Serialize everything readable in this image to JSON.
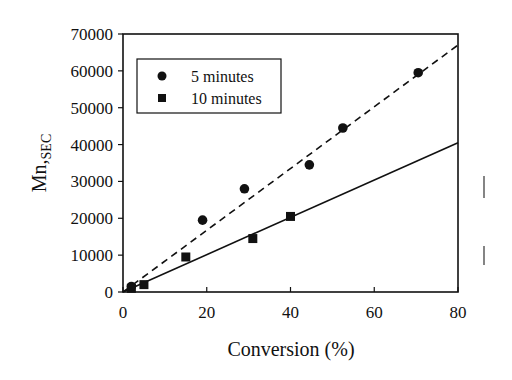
{
  "chart_data": {
    "type": "scatter",
    "title": "",
    "xlabel": "Conversion (%)",
    "ylabel": "Mn,SEC",
    "ylabel_main": "Mn,",
    "ylabel_sub": "SEC",
    "xlim": [
      0,
      80
    ],
    "ylim": [
      0,
      70000
    ],
    "xticks": [
      "0",
      "20",
      "40",
      "60",
      "80"
    ],
    "yticks": [
      "0",
      "10000",
      "20000",
      "30000",
      "40000",
      "50000",
      "60000",
      "70000"
    ],
    "grid": false,
    "legend_position": "upper-left-inside",
    "series": [
      {
        "name": "5 minutes",
        "marker": "circle",
        "points": [
          [
            2,
            1500
          ],
          [
            19,
            19500
          ],
          [
            29,
            28000
          ],
          [
            44.5,
            34500
          ],
          [
            52.5,
            44500
          ],
          [
            70.5,
            59500
          ]
        ],
        "fit_line": {
          "style": "dashed",
          "from": [
            0,
            0
          ],
          "to": [
            80,
            67000
          ]
        }
      },
      {
        "name": "10 minutes",
        "marker": "square",
        "points": [
          [
            2,
            1000
          ],
          [
            5,
            2000
          ],
          [
            15,
            9500
          ],
          [
            31,
            14500
          ],
          [
            40,
            20500
          ]
        ],
        "fit_line": {
          "style": "solid",
          "from": [
            0,
            0
          ],
          "to": [
            80,
            40500
          ]
        }
      }
    ]
  },
  "legend": {
    "items": [
      {
        "label": "5 minutes"
      },
      {
        "label": "10 minutes"
      }
    ]
  }
}
